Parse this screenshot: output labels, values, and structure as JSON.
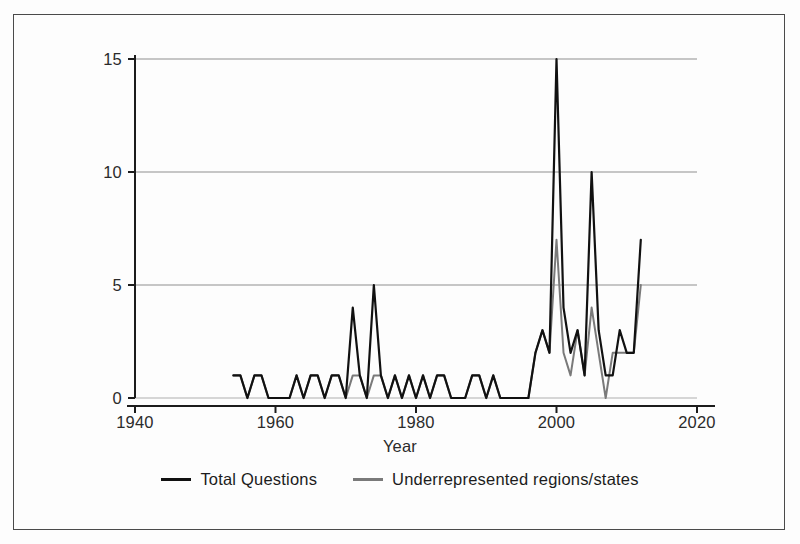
{
  "chart_data": {
    "type": "line",
    "title": "",
    "xlabel": "Year",
    "ylabel": "",
    "xlim": [
      1940,
      2020
    ],
    "ylim": [
      0,
      15
    ],
    "xticks": [
      1940,
      1960,
      1980,
      2000,
      2020
    ],
    "yticks": [
      0,
      5,
      10,
      15
    ],
    "grid": "horizontal",
    "legend_position": "bottom-center",
    "x": [
      1954,
      1955,
      1956,
      1957,
      1958,
      1959,
      1960,
      1961,
      1962,
      1963,
      1964,
      1965,
      1966,
      1967,
      1968,
      1969,
      1970,
      1971,
      1972,
      1973,
      1974,
      1975,
      1976,
      1977,
      1978,
      1979,
      1980,
      1981,
      1982,
      1983,
      1984,
      1985,
      1986,
      1987,
      1988,
      1989,
      1990,
      1991,
      1992,
      1993,
      1994,
      1995,
      1996,
      1997,
      1998,
      1999,
      2000,
      2001,
      2002,
      2003,
      2004,
      2005,
      2006,
      2007,
      2008,
      2009,
      2010,
      2011,
      2012
    ],
    "series": [
      {
        "name": "Total Questions",
        "color": "#111111",
        "values": [
          1,
          1,
          0,
          1,
          1,
          0,
          0,
          0,
          0,
          1,
          0,
          1,
          1,
          0,
          1,
          1,
          0,
          4,
          1,
          0,
          5,
          1,
          0,
          1,
          0,
          1,
          0,
          1,
          0,
          1,
          1,
          0,
          0,
          0,
          1,
          1,
          0,
          1,
          0,
          0,
          0,
          0,
          0,
          2,
          3,
          2,
          15,
          4,
          2,
          3,
          1,
          10,
          3,
          1,
          1,
          3,
          2,
          2,
          7
        ]
      },
      {
        "name": "Underrepresented regions/states",
        "color": "#7a7a7a",
        "values": [
          1,
          1,
          0,
          1,
          1,
          0,
          0,
          0,
          0,
          1,
          0,
          1,
          1,
          0,
          1,
          1,
          0,
          1,
          1,
          0,
          1,
          1,
          0,
          1,
          0,
          1,
          0,
          1,
          0,
          1,
          1,
          0,
          0,
          0,
          1,
          1,
          0,
          1,
          0,
          0,
          0,
          0,
          0,
          2,
          3,
          2,
          7,
          2,
          1,
          3,
          1,
          4,
          2,
          0,
          2,
          2,
          2,
          2,
          5
        ]
      }
    ]
  },
  "legend": {
    "entries": [
      {
        "label": "Total Questions"
      },
      {
        "label": "Underrepresented regions/states"
      }
    ]
  }
}
